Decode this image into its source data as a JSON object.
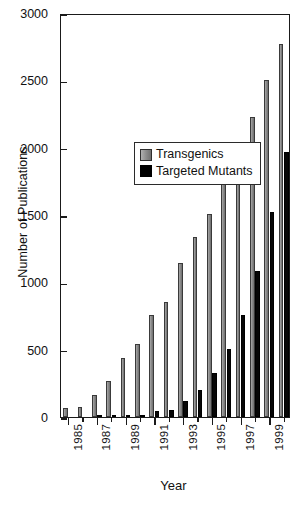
{
  "chart_data": {
    "type": "bar",
    "title": "",
    "xlabel": "Year",
    "ylabel": "Number of Publications",
    "ylim": [
      0,
      3000
    ],
    "yticks": [
      0,
      500,
      1000,
      1500,
      2000,
      2500,
      3000
    ],
    "ytick_labels": [
      "0",
      "500",
      "1000",
      "1500",
      "2000",
      "2500",
      "3000"
    ],
    "grid": false,
    "legend_position": "upper left inside",
    "categories": [
      "1985",
      "1986",
      "1987",
      "1988",
      "1989",
      "1990",
      "1991",
      "1992",
      "1993",
      "1994",
      "1995",
      "1996",
      "1997",
      "1998",
      "1999",
      "2000"
    ],
    "xtick_labels_shown": [
      "1985",
      "1987",
      "1989",
      "1991",
      "1993",
      "1995",
      "1997",
      "1999"
    ],
    "series": [
      {
        "name": "Transgenics",
        "color": "#8d8d8d",
        "values": [
          65,
          75,
          160,
          265,
          435,
          545,
          760,
          855,
          1140,
          1335,
          1510,
          1730,
          1970,
          2230,
          2500,
          2770
        ]
      },
      {
        "name": "Targeted Mutants",
        "color": "#000000",
        "values": [
          0,
          0,
          3,
          5,
          15,
          18,
          45,
          55,
          120,
          200,
          330,
          505,
          755,
          1085,
          1520,
          1970
        ]
      }
    ]
  },
  "axes": {
    "y_title": "Number of Publications",
    "x_title": "Year"
  },
  "legend": {
    "items": [
      {
        "label": "Transgenics",
        "swatch": "gray-square-icon"
      },
      {
        "label": "Targeted Mutants",
        "swatch": "black-square-icon"
      }
    ]
  }
}
